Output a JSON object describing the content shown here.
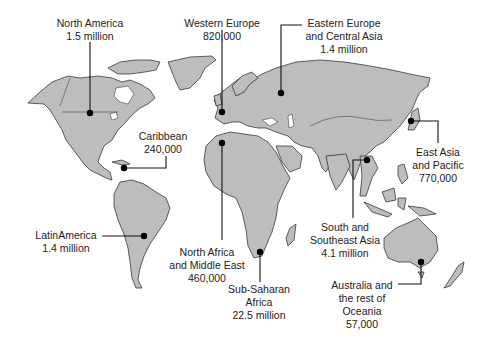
{
  "map": {
    "land_color": "#bdbdbd",
    "outline_color": "#222222",
    "marker_color": "#000000"
  },
  "regions": [
    {
      "id": "north-america",
      "name": "North America",
      "value": "1.5 million",
      "dot": [
        90,
        113
      ],
      "label_pos": [
        90,
        17
      ]
    },
    {
      "id": "western-europe",
      "name": "Western Europe",
      "value": "820,000",
      "dot": [
        222,
        112
      ],
      "label_pos": [
        222,
        17
      ]
    },
    {
      "id": "eastern-europe-central-asia",
      "name": "Eastern Europe and Central Asia",
      "lines": [
        "Eastern Europe",
        "and Central Asia"
      ],
      "value": "1.4 million",
      "dot": [
        281,
        93
      ],
      "label_pos": [
        342,
        17
      ]
    },
    {
      "id": "caribbean",
      "name": "Caribbean",
      "value": "240,000",
      "dot": [
        124,
        168
      ],
      "label_pos": [
        163,
        129
      ]
    },
    {
      "id": "east-asia-pacific",
      "name": "East Asia and Pacific",
      "lines": [
        "East Asia",
        "and Pacific"
      ],
      "value": "770,000",
      "dot": [
        411,
        121
      ],
      "label_pos": [
        438,
        147
      ]
    },
    {
      "id": "south-southeast-asia",
      "name": "South and Southeast Asia",
      "lines": [
        "South and",
        "Southeast Asia"
      ],
      "value": "4.1 million",
      "dot": [
        367,
        160
      ],
      "label_pos": [
        345,
        220
      ]
    },
    {
      "id": "latin-america",
      "name": "LatinAmerica",
      "value": "1.4 million",
      "dot": [
        144,
        236
      ],
      "label_pos": [
        66,
        229
      ]
    },
    {
      "id": "north-africa-middle-east",
      "name": "North Africa and Middle East",
      "lines": [
        "North Africa",
        "and Middle East"
      ],
      "value": "460,000",
      "dot": [
        222,
        143
      ],
      "label_pos": [
        207,
        247
      ]
    },
    {
      "id": "sub-saharan-africa",
      "name": "Sub-Saharan Africa",
      "lines": [
        "Sub-Saharan",
        "Africa"
      ],
      "value": "22.5 million",
      "dot": [
        260,
        252
      ],
      "label_pos": [
        259,
        283
      ]
    },
    {
      "id": "australia-oceania",
      "name": "Australia and the rest of Oceania",
      "lines": [
        "Australia and",
        "the rest of",
        "Oceania"
      ],
      "value": "57,000",
      "dot": [
        421,
        262
      ],
      "label_pos": [
        362,
        280
      ]
    }
  ]
}
